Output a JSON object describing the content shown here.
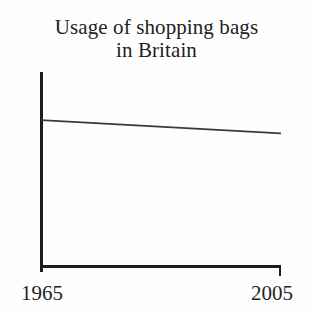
{
  "chart_data": {
    "type": "line",
    "title": "Usage of shopping bags in Britain",
    "title_lines": [
      "Usage of shopping bags",
      "in Britain"
    ],
    "xlabel": "",
    "ylabel": "",
    "x": [
      1965,
      2005
    ],
    "values": [
      100,
      91
    ],
    "series": [
      {
        "name": "Usage of shopping bags",
        "x": [
          1965,
          2005
        ],
        "values": [
          100,
          91
        ]
      }
    ],
    "xtick_labels": [
      "1965",
      "2005"
    ],
    "ytick_labels": [],
    "xlim": [
      1965,
      2005
    ],
    "ylim": [
      0,
      133
    ],
    "grid": false,
    "legend": false,
    "legend_position": "none",
    "annotations": [],
    "colors": {
      "background": "#fefefe",
      "axis": "#1d1d1d",
      "line": "#3a3a3a",
      "text": "#232323"
    }
  },
  "axes": {
    "y_axis_name": "vertical-axis",
    "x_axis_name": "horizontal-axis",
    "end_tick_label": "2005",
    "start_tick_label": "1965"
  }
}
